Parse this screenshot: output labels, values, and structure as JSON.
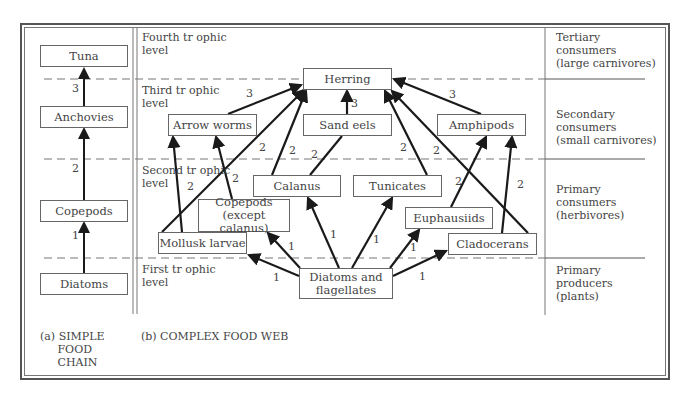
{
  "diagram": {
    "title_a": "(a) SIMPLE\n     FOOD\n     CHAIN",
    "title_b": "(b) COMPLEX FOOD WEB",
    "trophic_levels": [
      "Fourth tr ophic\nlevel",
      "Third tr ophic\nlevel",
      "Second tr ophic\nlevel",
      "First tr ophic\nlevel"
    ],
    "consumer_categories": [
      "Tertiary\nconsumers\n(large carnivores)",
      "Secondary\nconsumers\n(small carnivores)",
      "Primary\nconsumers\n(herbivores)",
      "Primary\nproducers\n(plants)"
    ],
    "simple_chain": {
      "nodes": [
        "Tuna",
        "Anchovies",
        "Copepods",
        "Diatoms"
      ],
      "link_labels": [
        "3",
        "2",
        "1"
      ]
    },
    "web_nodes": {
      "herring": "Herring",
      "arrow_worms": "Arrow worms",
      "sand_eels": "Sand eels",
      "amphipods": "Amphipods",
      "calanus": "Calanus",
      "tunicates": "Tunicates",
      "copepods_except": "Copepods (except\ncalanus)",
      "euphausiids": "Euphausiids",
      "mollusk_larvae": "Mollusk larvae",
      "cladocerans": "Cladocerans",
      "diatoms_flagellates": "Diatoms and\nflagellates"
    },
    "web_links": [
      {
        "from": "Diatoms and flagellates",
        "to": "Mollusk larvae",
        "label": "1"
      },
      {
        "from": "Diatoms and flagellates",
        "to": "Copepods (except calanus)",
        "label": "1"
      },
      {
        "from": "Diatoms and flagellates",
        "to": "Calanus",
        "label": "1"
      },
      {
        "from": "Diatoms and flagellates",
        "to": "Tunicates",
        "label": "1"
      },
      {
        "from": "Diatoms and flagellates",
        "to": "Euphausiids",
        "label": "1"
      },
      {
        "from": "Diatoms and flagellates",
        "to": "Cladocerans",
        "label": "1"
      },
      {
        "from": "Mollusk larvae",
        "to": "Arrow worms",
        "label": "2"
      },
      {
        "from": "Copepods (except calanus)",
        "to": "Arrow worms",
        "label": "2"
      },
      {
        "from": "Mollusk larvae",
        "to": "Herring",
        "label": "2"
      },
      {
        "from": "Calanus",
        "to": "Herring",
        "label": "2"
      },
      {
        "from": "Calanus",
        "to": "Sand eels",
        "label": "2"
      },
      {
        "from": "Tunicates",
        "to": "Herring",
        "label": "2"
      },
      {
        "from": "Cladocerans",
        "to": "Herring",
        "label": "2"
      },
      {
        "from": "Euphausiids",
        "to": "Amphipods",
        "label": "2"
      },
      {
        "from": "Cladocerans",
        "to": "Amphipods",
        "label": "2"
      },
      {
        "from": "Arrow worms",
        "to": "Herring",
        "label": "3"
      },
      {
        "from": "Sand eels",
        "to": "Herring",
        "label": "3"
      },
      {
        "from": "Amphipods",
        "to": "Herring",
        "label": "3"
      }
    ],
    "colors": {
      "line": "#1a1a1a",
      "box_border": "#666666",
      "dash": "#777777",
      "text": "#444444"
    }
  }
}
